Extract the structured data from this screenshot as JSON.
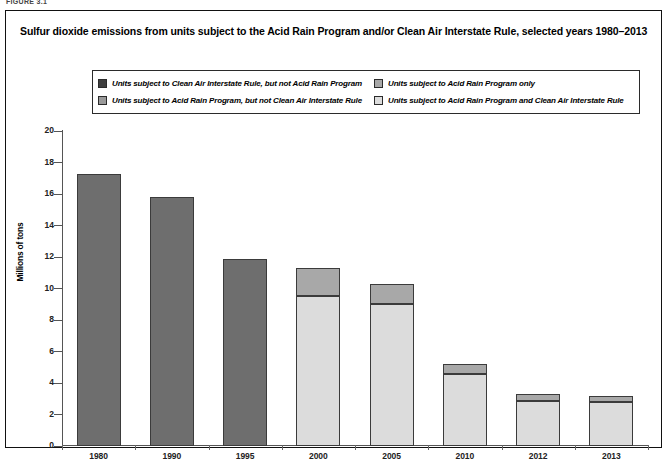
{
  "figure_caption": "FIGURE 3.1",
  "chart_title": "Sulfur dioxide emissions from units subject to the Acid Rain Program and/or Clean Air Interstate Rule, selected years 1980–2013",
  "legend": {
    "items": [
      {
        "label": "Units subject to Clean Air Interstate Rule, but not Acid Rain Program",
        "color": "#3f3f3f",
        "column": 1
      },
      {
        "label": "Units subject to Acid Rain Program, but not Clean Air Interstate Rule",
        "color": "#9a9a9a",
        "column": 1
      },
      {
        "label": "Units subject to Acid Rain Program only",
        "color": "#a8a8a8",
        "column": 2
      },
      {
        "label": "Units subject to Acid Rain Program and Clean Air Interstate Rule",
        "color": "#dcdcdc",
        "column": 2
      }
    ]
  },
  "chart_data": {
    "type": "bar",
    "stacked": true,
    "title": "Sulfur dioxide emissions from units subject to the Acid Rain Program and/or Clean Air Interstate Rule, selected years 1980–2013",
    "xlabel": "",
    "ylabel": "Millions of tons",
    "ylim": [
      0,
      20
    ],
    "ytick_step": 2,
    "yticks": [
      0,
      2,
      4,
      6,
      8,
      10,
      12,
      14,
      16,
      18,
      20
    ],
    "ytick_labels": [
      "0",
      "2",
      "4",
      "6",
      "8",
      "10",
      "12",
      "14",
      "16",
      "18",
      "20"
    ],
    "grid": false,
    "legend_position": "top",
    "categories": [
      "1980",
      "1990",
      "1995",
      "2000",
      "2005",
      "2010",
      "2012",
      "2013"
    ],
    "series": [
      {
        "name": "Units subject to Acid Rain Program and Clean Air Interstate Rule",
        "color": "#dcdcdc",
        "values": [
          0,
          0,
          0,
          9.5,
          9.0,
          4.6,
          2.85,
          2.8
        ]
      },
      {
        "name": "Units subject to Acid Rain Program only",
        "color": "#a8a8a8",
        "values": [
          0,
          0,
          0,
          1.8,
          1.3,
          0.6,
          0.45,
          0.4
        ]
      },
      {
        "name": "Units subject to Clean Air Interstate Rule, but not Acid Rain Program",
        "color": "#6e6e6e",
        "values": [
          17.3,
          15.8,
          11.9,
          0,
          0,
          0,
          0,
          0
        ]
      }
    ],
    "totals": [
      17.3,
      15.8,
      11.9,
      11.3,
      10.3,
      5.2,
      3.3,
      3.2
    ]
  },
  "colors": {
    "dark_swatch": "#3f3f3f",
    "mid_swatch": "#9a9a9a",
    "bar_dark": "#6e6e6e",
    "bar_mid": "#a8a8a8",
    "bar_light": "#dcdcdc",
    "outline": "#3b3b3b",
    "axis": "#555555"
  }
}
